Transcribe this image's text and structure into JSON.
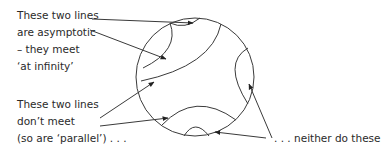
{
  "labels": {
    "asymptotic": [
      "These two lines",
      "are asymptotic",
      "– they meet",
      "‘at infinity’"
    ],
    "parallel": [
      "These two lines",
      "don’t meet",
      "(so are ‘parallel’) . . ."
    ],
    "neither": ". . . neither do these"
  },
  "colors": {
    "stroke": "#3a3a3a",
    "text": "#2a2a2a",
    "background": "#ffffff"
  }
}
